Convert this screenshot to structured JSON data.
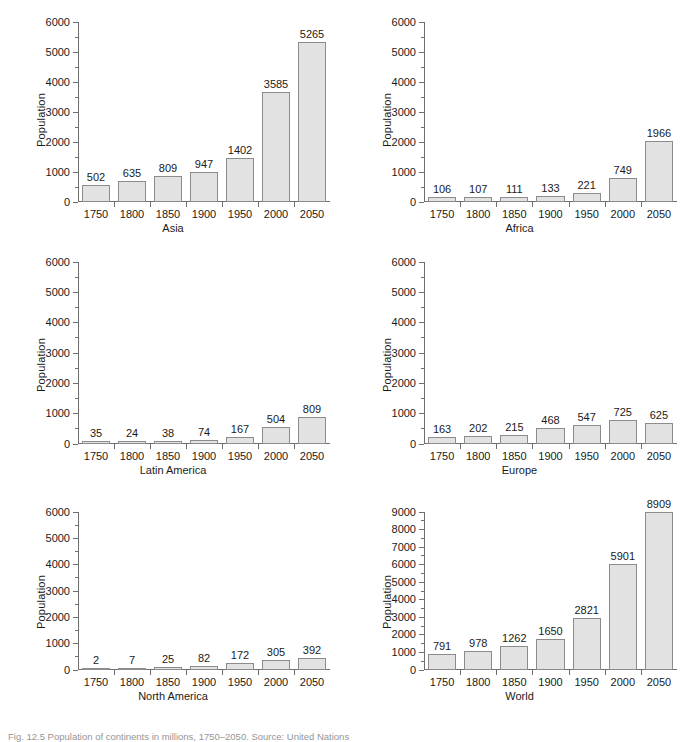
{
  "figure": {
    "caption": "Fig. 12.5   Population of continents in millions, 1750–2050. Source: United Nations",
    "ylabel": "Population",
    "categories": [
      "1750",
      "1800",
      "1850",
      "1900",
      "1950",
      "2000",
      "2050"
    ],
    "bar_fill": "#e2e2e2",
    "bar_border": "#8c8c8c",
    "axis_color": "#6f6f6f"
  },
  "chart_data": [
    {
      "type": "bar",
      "title": "Asia",
      "xlabel": "Asia",
      "ylabel": "Population",
      "categories": [
        "1750",
        "1800",
        "1850",
        "1900",
        "1950",
        "2000",
        "2050"
      ],
      "values": [
        502,
        635,
        809,
        947,
        1402,
        3585,
        5265
      ],
      "ylim": [
        0,
        6000
      ],
      "ytick_step": 1000,
      "yminor_step": 500,
      "yticks": [
        0,
        1000,
        2000,
        3000,
        4000,
        5000,
        6000
      ],
      "grid": false,
      "legend": "none",
      "data_labels": true
    },
    {
      "type": "bar",
      "title": "Africa",
      "xlabel": "Africa",
      "ylabel": "Population",
      "categories": [
        "1750",
        "1800",
        "1850",
        "1900",
        "1950",
        "2000",
        "2050"
      ],
      "values": [
        106,
        107,
        111,
        133,
        221,
        749,
        1966
      ],
      "ylim": [
        0,
        6000
      ],
      "ytick_step": 1000,
      "yminor_step": 500,
      "yticks": [
        0,
        1000,
        2000,
        3000,
        4000,
        5000,
        6000
      ],
      "grid": false,
      "legend": "none",
      "data_labels": true
    },
    {
      "type": "bar",
      "title": "Latin America",
      "xlabel": "Latin America",
      "ylabel": "Population",
      "categories": [
        "1750",
        "1800",
        "1850",
        "1900",
        "1950",
        "2000",
        "2050"
      ],
      "values": [
        35,
        24,
        38,
        74,
        167,
        504,
        809
      ],
      "ylim": [
        0,
        6000
      ],
      "ytick_step": 1000,
      "yminor_step": 500,
      "yticks": [
        0,
        1000,
        2000,
        3000,
        4000,
        5000,
        6000
      ],
      "grid": false,
      "legend": "none",
      "data_labels": true
    },
    {
      "type": "bar",
      "title": "Europe",
      "xlabel": "Europe",
      "ylabel": "Population",
      "categories": [
        "1750",
        "1800",
        "1850",
        "1900",
        "1950",
        "2000",
        "2050"
      ],
      "values": [
        163,
        202,
        215,
        468,
        547,
        725,
        625
      ],
      "ylim": [
        0,
        6000
      ],
      "ytick_step": 1000,
      "yminor_step": 500,
      "yticks": [
        0,
        1000,
        2000,
        3000,
        4000,
        5000,
        6000
      ],
      "grid": false,
      "legend": "none",
      "data_labels": true
    },
    {
      "type": "bar",
      "title": "North America",
      "xlabel": "North America",
      "ylabel": "Population",
      "categories": [
        "1750",
        "1800",
        "1850",
        "1900",
        "1950",
        "2000",
        "2050"
      ],
      "values": [
        2,
        7,
        25,
        82,
        172,
        305,
        392
      ],
      "ylim": [
        0,
        6000
      ],
      "ytick_step": 1000,
      "yminor_step": 500,
      "yticks": [
        0,
        1000,
        2000,
        3000,
        4000,
        5000,
        6000
      ],
      "grid": false,
      "legend": "none",
      "data_labels": true
    },
    {
      "type": "bar",
      "title": "World",
      "xlabel": "World",
      "ylabel": "Population",
      "categories": [
        "1750",
        "1800",
        "1850",
        "1900",
        "1950",
        "2000",
        "2050"
      ],
      "values": [
        791,
        978,
        1262,
        1650,
        2821,
        5901,
        8909
      ],
      "ylim": [
        0,
        9000
      ],
      "ytick_step": 1000,
      "yminor_step": 500,
      "yticks": [
        0,
        1000,
        2000,
        3000,
        4000,
        5000,
        6000,
        7000,
        8000,
        9000
      ],
      "grid": false,
      "legend": "none",
      "data_labels": true
    }
  ]
}
